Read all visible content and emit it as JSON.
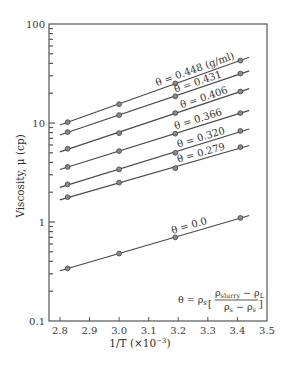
{
  "chart_data": {
    "type": "line",
    "title": "",
    "xlabel": "1/T (×10⁻³)",
    "ylabel": "Viscosity, μ (cp)",
    "xlim": [
      2.763,
      3.5
    ],
    "ylim": [
      0.1,
      100
    ],
    "yscale": "log",
    "grid": false,
    "legend": "inline labels on lines",
    "x_ticks": [
      "2.8",
      "2.9",
      "3.0",
      "3.1",
      "3.2",
      "3.3",
      "3.4",
      "3.5"
    ],
    "y_ticks": [
      "0.1",
      "1",
      "10",
      "100"
    ],
    "x": [
      2.826,
      3.0,
      3.19,
      3.41
    ],
    "series": [
      {
        "name": "θ = 0.448 (g/ml)",
        "values": [
          10.2,
          15.5,
          25.1,
          42.7
        ]
      },
      {
        "name": "θ = 0.431",
        "values": [
          8.1,
          12.0,
          18.6,
          31.6
        ]
      },
      {
        "name": "θ = 0.406",
        "values": [
          5.5,
          7.9,
          12.6,
          20.8
        ]
      },
      {
        "name": "θ = 0.366",
        "values": [
          3.6,
          5.2,
          7.8,
          12.6
        ]
      },
      {
        "name": "θ = 0.320",
        "values": [
          2.4,
          3.4,
          5.0,
          8.3
        ]
      },
      {
        "name": "θ = 0.279",
        "values": [
          1.78,
          2.5,
          3.5,
          5.7
        ]
      },
      {
        "name": "θ = 0.0",
        "values": [
          0.34,
          0.48,
          0.7,
          1.1
        ]
      }
    ],
    "annotation": "θ = ρs [(ρslurry − ρL) / (ρs − ρs)]"
  },
  "labels": {
    "xlabel_main": "1/T (×10",
    "xlabel_exp": "−3",
    "xlabel_close": ")",
    "ylabel": "Viscosity, μ (cp)",
    "formula_lhs": "θ = ρ",
    "formula_lhs_sub": "s",
    "formula_num": "ρ",
    "formula_num_sub": "slurry",
    "formula_num_rest": " − ρ",
    "formula_num_sub2": "L",
    "formula_den": "ρ",
    "formula_den_sub": "s",
    "formula_den_rest": " − ρ",
    "formula_den_sub2": "s"
  },
  "colors": {
    "axis": "#555555",
    "line": "#4a4a4a",
    "marker_fill": "#8a8a8a",
    "marker_stroke": "#4a4a4a"
  }
}
